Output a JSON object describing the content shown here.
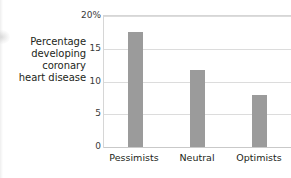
{
  "chart_data": {
    "type": "bar",
    "title": "",
    "subtitle": "",
    "xlabel": "",
    "ylabel": "Percentage developing coronary heart disease",
    "ylabel_lines": [
      "Percentage",
      "developing",
      "coronary",
      "heart disease"
    ],
    "categories": [
      "Pessimists",
      "Neutral",
      "Optimists"
    ],
    "values": [
      17.5,
      11.8,
      8.0
    ],
    "series": [
      {
        "name": "Percentage developing coronary heart disease",
        "values": [
          17.5,
          11.8,
          8.0
        ]
      }
    ],
    "ylim": [
      0,
      20
    ],
    "xlim": [
      0,
      3
    ],
    "yticks": [
      0,
      5,
      10,
      15,
      20
    ],
    "ytick_labels": [
      "0",
      "5",
      "10",
      "15",
      "20%"
    ],
    "grid": true,
    "grid_axis": "y",
    "legend": false,
    "legend_position": "none",
    "bar_color": "#9b9b9b",
    "grid_color": "#dcdcdc",
    "frame_color": "#d6d6d6",
    "text_color": "#231f20",
    "background": "#ffffff",
    "annotations": []
  }
}
